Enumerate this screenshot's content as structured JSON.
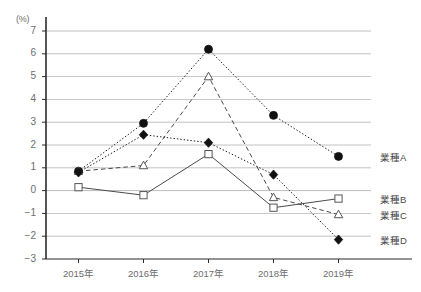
{
  "chart_data": {
    "type": "line",
    "title": "",
    "subtitle": "",
    "xlabel": "",
    "ylabel": "(%)",
    "unit_label": "(%)",
    "categories": [
      "2015年",
      "2016年",
      "2017年",
      "2018年",
      "2019年"
    ],
    "x": [
      2015,
      2016,
      2017,
      2018,
      2019
    ],
    "ylim": [
      -3,
      7
    ],
    "ytick_values": [
      7,
      6,
      5,
      4,
      3,
      2,
      1,
      0,
      -1,
      -2,
      -3
    ],
    "ytick_labels": [
      "7",
      "6",
      "5",
      "4",
      "3",
      "2",
      "1",
      "0",
      "−1",
      "−2",
      "−3"
    ],
    "grid": true,
    "grid_axis": "y",
    "legend_position": "right-inline",
    "series": [
      {
        "name": "業種A",
        "marker": "filled-circle",
        "line_style": "dotted",
        "color": "#1a1a1a",
        "values": [
          0.85,
          2.95,
          6.2,
          3.3,
          1.5
        ]
      },
      {
        "name": "業種B",
        "marker": "open-square",
        "line_style": "solid",
        "color": "#4a4a4a",
        "values": [
          0.15,
          -0.2,
          1.6,
          -0.75,
          -0.35
        ]
      },
      {
        "name": "業種C",
        "marker": "open-triangle",
        "line_style": "dashed",
        "color": "#4a4a4a",
        "values": [
          0.85,
          1.1,
          5.0,
          -0.3,
          -1.05
        ]
      },
      {
        "name": "業種D",
        "marker": "filled-diamond",
        "line_style": "dotted",
        "color": "#1a1a1a",
        "values": [
          0.8,
          2.45,
          2.1,
          0.7,
          -2.15
        ]
      }
    ]
  },
  "legend": {
    "entries": [
      {
        "label": "業種A",
        "series": 0
      },
      {
        "label": "業種B",
        "series": 1
      },
      {
        "label": "業種C",
        "series": 2
      },
      {
        "label": "業種D",
        "series": 3
      }
    ]
  },
  "colors": {
    "axis": "#2b2b2b",
    "grid": "#9a9a9a",
    "tick_text": "#6d6d6d",
    "legend_text": "#4a4a4a",
    "marker_fill_dark": "#111111",
    "marker_fill_open": "#ffffff"
  }
}
